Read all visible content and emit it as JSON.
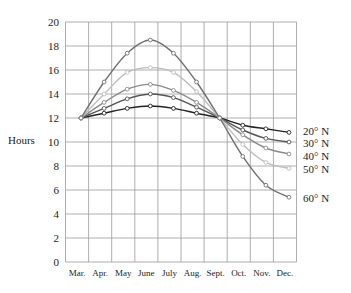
{
  "chart_data": {
    "type": "line",
    "title": "",
    "xlabel": "",
    "ylabel": "Hours",
    "ylim": [
      0,
      20
    ],
    "yticks": [
      0,
      2,
      4,
      6,
      8,
      10,
      12,
      14,
      16,
      18,
      20
    ],
    "grid": true,
    "legend_position": "right-end-labels",
    "categories": [
      "Mar.",
      "Apr.",
      "May",
      "June",
      "July",
      "Aug.",
      "Sept.",
      "Oct.",
      "Nov.",
      "Dec."
    ],
    "series": [
      {
        "name": "20° N",
        "color": "#222222",
        "values": [
          12.0,
          12.4,
          12.8,
          13.0,
          12.8,
          12.4,
          12.0,
          11.4,
          11.1,
          10.8
        ]
      },
      {
        "name": "30° N",
        "color": "#555555",
        "values": [
          12.0,
          12.8,
          13.6,
          14.0,
          13.7,
          12.9,
          12.0,
          11.0,
          10.3,
          10.0
        ]
      },
      {
        "name": "40° N",
        "color": "#8a8a8a",
        "values": [
          12.0,
          13.3,
          14.4,
          14.8,
          14.3,
          13.3,
          12.0,
          10.6,
          9.5,
          9.0
        ]
      },
      {
        "name": "50° N",
        "color": "#bdbdbd",
        "values": [
          12.0,
          14.0,
          15.8,
          16.2,
          15.8,
          14.2,
          12.0,
          9.8,
          8.3,
          7.8
        ]
      },
      {
        "name": "60° N",
        "color": "#707070",
        "values": [
          12.0,
          15.0,
          17.4,
          18.5,
          17.4,
          15.0,
          12.0,
          8.8,
          6.4,
          5.4
        ]
      }
    ]
  }
}
